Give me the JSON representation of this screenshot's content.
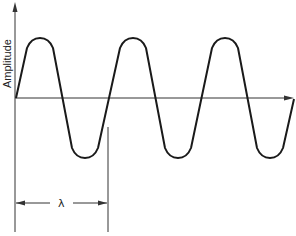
{
  "diagram": {
    "y_axis_label": "Amplitude",
    "dimension_label": "λ",
    "colors": {
      "stroke": "#1a1a1a",
      "axis": "#333333",
      "background": "#ffffff"
    },
    "wave": {
      "peaks_x": [
        40,
        133,
        225
      ],
      "troughs_x": [
        85,
        178,
        270
      ],
      "peak_y": 39,
      "trough_y": 157,
      "axis_y": 98
    }
  }
}
